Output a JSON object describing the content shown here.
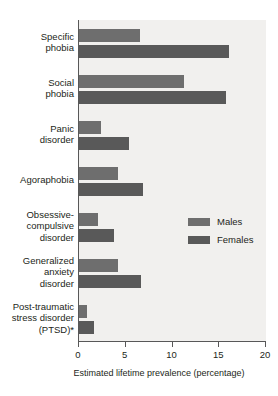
{
  "chart_data": {
    "type": "bar",
    "orientation": "horizontal",
    "title": "",
    "xlabel": "Estimated lifetime prevalence (percentage)",
    "ylabel": "",
    "xlim": [
      0,
      20
    ],
    "xticks": [
      0,
      5,
      10,
      15,
      20
    ],
    "xtick_labels": [
      "0",
      "5",
      "10",
      "15",
      "20"
    ],
    "grid": false,
    "legend_position": "center-right",
    "categories": [
      "Specific\nphobia",
      "Social\nphobia",
      "Panic\ndisorder",
      "Agoraphobia",
      "Obsessive-\ncompulsive\ndisorder",
      "Generalized\nanxiety\ndisorder",
      "Post-traumatic\nstress disorder\n(PTSD)*"
    ],
    "series": [
      {
        "name": "Males",
        "color": "#6e6e6e",
        "values": [
          6.5,
          11.2,
          2.3,
          4.2,
          2.0,
          4.2,
          0.9
        ]
      },
      {
        "name": "Females",
        "color": "#595959",
        "values": [
          16.0,
          15.7,
          5.4,
          6.8,
          3.7,
          6.6,
          1.6
        ]
      }
    ]
  },
  "legend": {
    "entries": [
      {
        "label": "Males",
        "color": "#6e6e6e"
      },
      {
        "label": "Females",
        "color": "#595959"
      }
    ]
  },
  "colors": {
    "plot_background": "#f1f0ee",
    "axis": "#585858",
    "text": "#231f20",
    "males": "#6e6e6e",
    "females": "#595959"
  }
}
